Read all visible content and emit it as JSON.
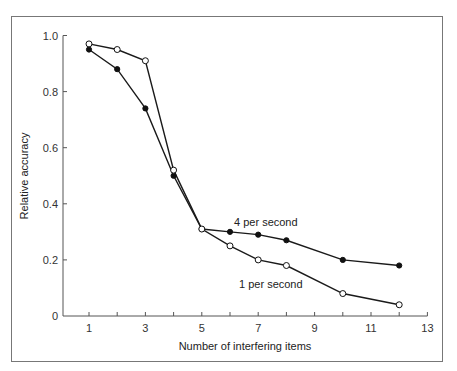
{
  "chart_data": {
    "type": "line",
    "title": "",
    "xlabel": "Number of interfering items",
    "ylabel": "Relative accuracy",
    "xlim": [
      0,
      13
    ],
    "ylim": [
      0,
      1.0
    ],
    "x_ticks": [
      "1",
      "3",
      "5",
      "7",
      "9",
      "11",
      "13"
    ],
    "x_minor_ticks": [
      2,
      4,
      6,
      8,
      10,
      12
    ],
    "y_ticks": [
      "0",
      "0.2",
      "0.4",
      "0.6",
      "0.8",
      "1.0"
    ],
    "grid": false,
    "legend": "inline labels",
    "series": [
      {
        "name": "4 per second",
        "marker": "filled-circle",
        "x": [
          1,
          2,
          3,
          4,
          5,
          6,
          7,
          8,
          10,
          12
        ],
        "values": [
          0.95,
          0.88,
          0.74,
          0.5,
          0.31,
          0.3,
          0.29,
          0.27,
          0.2,
          0.18
        ]
      },
      {
        "name": "1 per second",
        "marker": "open-circle",
        "x": [
          1,
          2,
          3,
          4,
          5,
          6,
          7,
          8,
          10,
          12
        ],
        "values": [
          0.97,
          0.95,
          0.91,
          0.52,
          0.31,
          0.25,
          0.2,
          0.18,
          0.08,
          0.04
        ]
      }
    ],
    "annotations": [
      {
        "text": "4 per second",
        "x": 6.2,
        "y": 0.34
      },
      {
        "text": "1 per second",
        "x": 6.3,
        "y": 0.12
      }
    ]
  },
  "labels": {
    "series_4ps": "4 per second",
    "series_1ps": "1 per second",
    "xlabel": "Number of interfering items",
    "ylabel": "Relative accuracy"
  }
}
